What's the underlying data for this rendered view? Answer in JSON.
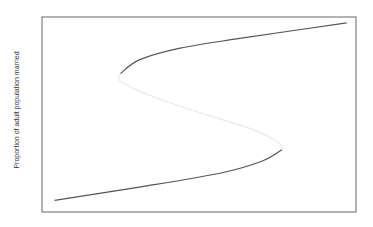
{
  "chart_data": {
    "type": "line",
    "title": "",
    "xlabel": "",
    "ylabel": "Proportion of adult population married",
    "xlim": [
      0,
      1
    ],
    "ylim": [
      0,
      1
    ],
    "grid": false,
    "legend": "none",
    "series": [
      {
        "name": "lower-stable-branch",
        "style": "solid",
        "color": "#555555",
        "x": [
          0.04,
          0.32,
          0.57,
          0.7,
          0.765
        ],
        "y": [
          0.06,
          0.13,
          0.2,
          0.26,
          0.32
        ]
      },
      {
        "name": "unstable-middle-branch",
        "style": "solid",
        "color": "#e8e8e8",
        "x": [
          0.765,
          0.75,
          0.66,
          0.5,
          0.34,
          0.25,
          0.25
        ],
        "y": [
          0.32,
          0.36,
          0.43,
          0.51,
          0.6,
          0.67,
          0.71
        ]
      },
      {
        "name": "upper-stable-branch",
        "style": "solid",
        "color": "#555555",
        "x": [
          0.25,
          0.31,
          0.44,
          0.63,
          0.97
        ],
        "y": [
          0.71,
          0.78,
          0.84,
          0.89,
          0.97
        ]
      }
    ]
  }
}
